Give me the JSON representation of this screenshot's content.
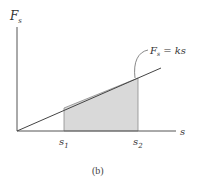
{
  "figure": {
    "caption": "(b)",
    "y_axis_label": "F",
    "y_axis_subscript": "s",
    "x_axis_label": "s",
    "line_label": {
      "lhs": "F",
      "lhs_subscript": "s",
      "rhs": " = ks"
    },
    "ticks": [
      {
        "base": "s",
        "sub": "1"
      },
      {
        "base": "s",
        "sub": "2"
      }
    ],
    "colors": {
      "axis": "#555555",
      "line": "#444444",
      "shade": "#d8d8d8",
      "shade_edge": "#888888"
    }
  }
}
